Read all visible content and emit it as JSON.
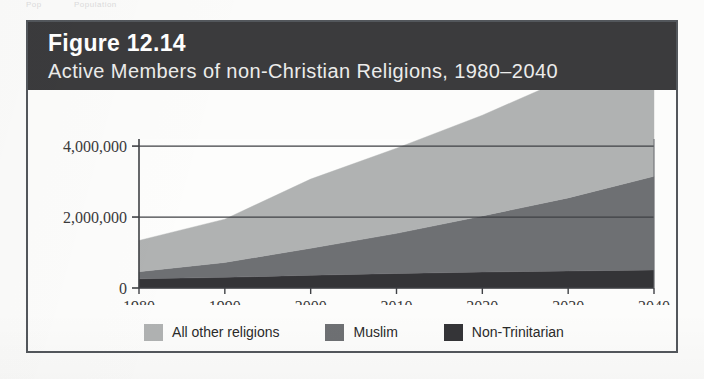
{
  "page_header": {
    "left_text": "Pop",
    "right_text": "Population"
  },
  "figure": {
    "number_label": "Figure 12.14",
    "title": "Active Members of non-Christian Religions, 1980–2040",
    "titlebar_color": "#3b3b3d",
    "border_color": "#53575c"
  },
  "chart_data": {
    "type": "area",
    "stacked": true,
    "title": "Active Members of non-Christian Religions, 1980–2040",
    "xlabel": "",
    "ylabel": "",
    "x": [
      1980,
      1990,
      2000,
      2010,
      2020,
      2030,
      2040
    ],
    "categories": [
      "1980",
      "1990",
      "2000",
      "2010",
      "2020",
      "2030",
      "2040"
    ],
    "xtick_labels": [
      "1980",
      "1990",
      "2000",
      "2010",
      "2020",
      "2030",
      "2040"
    ],
    "ytick_labels": [
      "0",
      "2,000,000",
      "4,000,000"
    ],
    "ytick_values": [
      0,
      2000000,
      4000000
    ],
    "ylim": [
      0,
      4200000
    ],
    "xlim": [
      1980,
      2040
    ],
    "grid": true,
    "legend_position": "bottom",
    "series": [
      {
        "name": "Non-Trinitarian",
        "color": "#343437",
        "values": [
          260000,
          300000,
          360000,
          410000,
          450000,
          480000,
          510000
        ]
      },
      {
        "name": "Muslim",
        "color": "#6e7073",
        "values": [
          200000,
          420000,
          760000,
          1130000,
          1580000,
          2060000,
          2640000
        ]
      },
      {
        "name": "All other religions",
        "color": "#b0b2b2",
        "values": [
          880000,
          1220000,
          1950000,
          2400000,
          2840000,
          3390000,
          3950000
        ]
      }
    ],
    "series_note_cumulative_tops": true,
    "legend": [
      {
        "label": "All other religions",
        "color": "#b0b2b2"
      },
      {
        "label": "Muslim",
        "color": "#6e7073"
      },
      {
        "label": "Non-Trinitarian",
        "color": "#343437"
      }
    ]
  }
}
